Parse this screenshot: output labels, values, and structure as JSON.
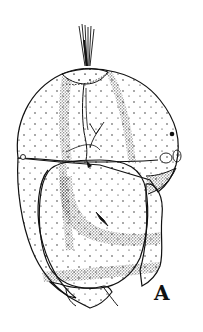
{
  "figure": {
    "type": "scientific-line-drawing",
    "panel_label": "A",
    "ink_color": "#111111",
    "background_color": "#ffffff"
  }
}
